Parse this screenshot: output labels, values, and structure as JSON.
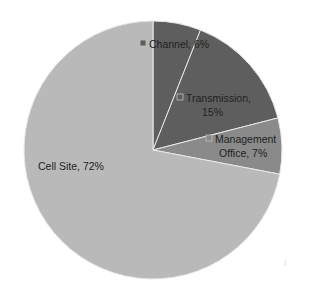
{
  "chart_data": {
    "type": "pie",
    "title": "",
    "start_angle_deg": 0,
    "direction": "clockwise",
    "legend": "none (data labels inside slices)",
    "categories": [
      "Channel",
      "Transmission",
      "Management Office",
      "Cell Site"
    ],
    "values": [
      6,
      15,
      7,
      72
    ],
    "unit": "%",
    "colors": [
      "#5e5e5e",
      "#5e5e5e",
      "#8a8a8a",
      "#b9b9b9"
    ],
    "data_labels": [
      {
        "name": "Channel",
        "value": "6%",
        "lines": [
          "Channel, 6%"
        ]
      },
      {
        "name": "Transmission",
        "value": "15%",
        "lines": [
          "Transmission,",
          "15%"
        ]
      },
      {
        "name": "Management Office",
        "value": "7%",
        "lines": [
          "Management",
          "Office, 7%"
        ]
      },
      {
        "name": "Cell Site",
        "value": "72%",
        "lines": [
          "Cell Site, 72%"
        ]
      }
    ]
  },
  "geometry": {
    "cx": 153,
    "cy": 150,
    "r": 129
  },
  "slice_border_color": "#e8e8e8"
}
